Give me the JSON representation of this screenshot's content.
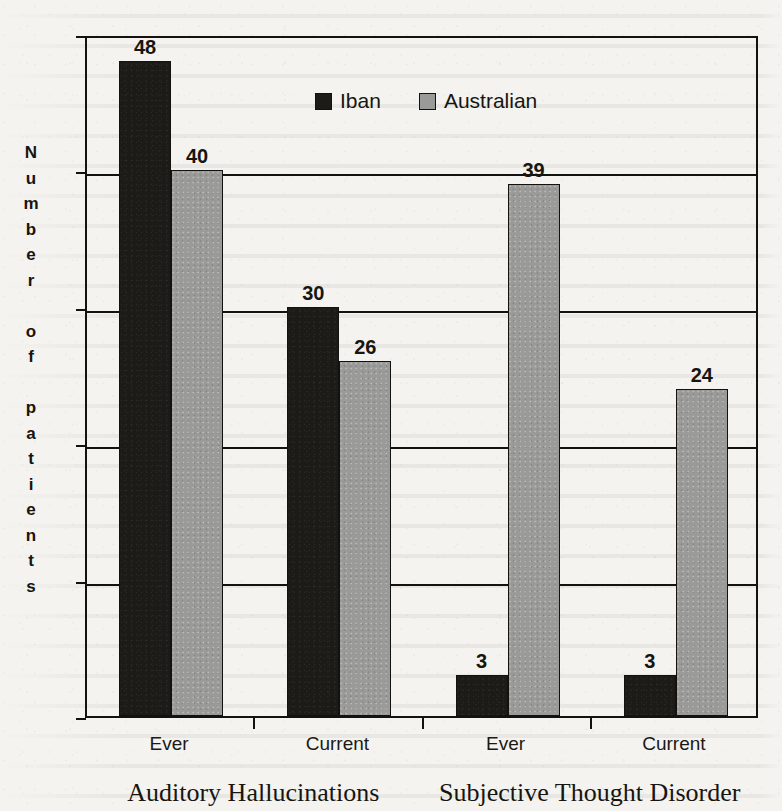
{
  "chart_data": {
    "type": "bar",
    "title": "",
    "subtitle": "",
    "xlabel": "",
    "ylabel": "Number of patients",
    "ylim": [
      0,
      50
    ],
    "yticks": [
      0,
      10,
      20,
      30,
      40,
      50
    ],
    "grid": true,
    "legend_position": "top-center",
    "categories": [
      "Ever",
      "Current",
      "Ever",
      "Current"
    ],
    "group_labels": [
      "Auditory Hallucinations",
      "Subjective Thought Disorder"
    ],
    "series": [
      {
        "name": "Iban",
        "color": "#1d1b18",
        "values": [
          48,
          30,
          3,
          3
        ]
      },
      {
        "name": "Australian",
        "color": "#9a9a98",
        "values": [
          40,
          26,
          39,
          24
        ]
      }
    ],
    "data_labels": [
      {
        "category": "Ever",
        "group": "Auditory Hallucinations",
        "series": "Iban",
        "value": 48
      },
      {
        "category": "Ever",
        "group": "Auditory Hallucinations",
        "series": "Australian",
        "value": 40
      },
      {
        "category": "Current",
        "group": "Auditory Hallucinations",
        "series": "Iban",
        "value": 30
      },
      {
        "category": "Current",
        "group": "Auditory Hallucinations",
        "series": "Australian",
        "value": 26
      },
      {
        "category": "Ever",
        "group": "Subjective Thought Disorder",
        "series": "Iban",
        "value": 3
      },
      {
        "category": "Ever",
        "group": "Subjective Thought Disorder",
        "series": "Australian",
        "value": 39
      },
      {
        "category": "Current",
        "group": "Subjective Thought Disorder",
        "series": "Iban",
        "value": 3
      },
      {
        "category": "Current",
        "group": "Subjective Thought Disorder",
        "series": "Australian",
        "value": 24
      }
    ]
  },
  "axis": {
    "y_tick_labels": [
      "50",
      "40",
      "30",
      "20",
      "10",
      "0"
    ],
    "y_title_chars": [
      "N",
      "u",
      "m",
      "b",
      "e",
      "r",
      "",
      "o",
      "f",
      "",
      "p",
      "a",
      "t",
      "i",
      "e",
      "n",
      "t",
      "s"
    ]
  },
  "legend": {
    "items": [
      {
        "label": "Iban",
        "color": "#1d1b18"
      },
      {
        "label": "Australian",
        "color": "#9a9a98"
      }
    ]
  },
  "colors": {
    "iban": "#1d1b18",
    "australian": "#9a9a98",
    "axis": "#14120f",
    "paper": "#f4f3f0"
  }
}
